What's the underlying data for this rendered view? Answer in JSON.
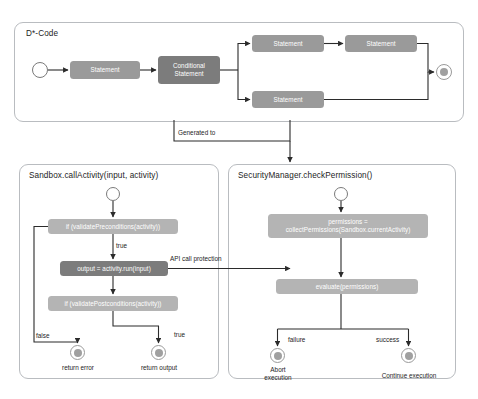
{
  "diagram": {
    "type": "uml-activity-diagram",
    "background": "#ffffff",
    "colors": {
      "node_light": "#a8a8a8",
      "node_mid": "#9a9a9a",
      "node_dark": "#7c7c7c",
      "panel_border": "#b9bcc0",
      "edge": "#2b2b2b",
      "text_dark": "#1d1d1d",
      "text_on_node": "#ffffff"
    }
  },
  "top_panel": {
    "title": "D*-Code",
    "nodes": {
      "statement_1": "Statement",
      "conditional": "Conditional\nStatement",
      "statement_branch_a1": "Statement",
      "statement_branch_a2": "Statement",
      "statement_branch_b": "Statement"
    }
  },
  "connector": {
    "generated_to_label": "Generated to"
  },
  "sandbox_panel": {
    "title": "Sandbox.callActivity(input, activity)",
    "nodes": {
      "precondition": "if (validatePreconditions(activity))",
      "run": "output = activity.run(input)",
      "postcondition": "if (validatePostconditions(activity))"
    },
    "edge_labels": {
      "true_precondition": "true",
      "false_branch": "false",
      "true_branch": "true",
      "api_call_protection": "API call protection"
    },
    "end_nodes": {
      "error": "return error",
      "output": "return output"
    }
  },
  "security_panel": {
    "title": "SecurityManager.checkPermission()",
    "nodes": {
      "collect": "permissions =\ncollectPermissions(Sandbox.currentActivity)",
      "evaluate": "evaluate(permissions)"
    },
    "edge_labels": {
      "failure": "failure",
      "success": "success"
    },
    "end_nodes": {
      "abort": "Abort\nexecution",
      "continue": "Continue execution"
    }
  }
}
